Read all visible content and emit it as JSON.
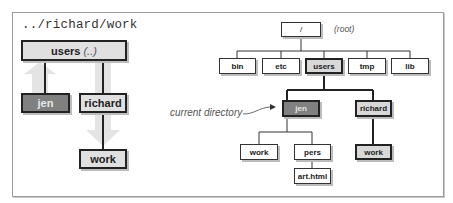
{
  "left_panel": {
    "path_text": "../richard/work",
    "users_box": {
      "label": "users",
      "annotation": "(..)"
    },
    "jen_box": {
      "label": "jen"
    },
    "richard_box": {
      "label": "richard"
    },
    "work_box": {
      "label": "work"
    },
    "arrows": [
      {
        "from": "jen",
        "to": "users",
        "direction": "up"
      },
      {
        "from": "richard",
        "to": "work",
        "direction": "down"
      }
    ]
  },
  "right_panel": {
    "root": {
      "label": "/",
      "annotation": "(root)"
    },
    "level1": [
      "bin",
      "etc",
      "users",
      "tmp",
      "lib"
    ],
    "highlighted_level1": "users",
    "users_children": [
      "jen",
      "richard"
    ],
    "jen_children": [
      "work",
      "pers"
    ],
    "pers_children": [
      "art.html"
    ],
    "richard_children": [
      "work"
    ],
    "callout": "current directory",
    "callout_target": "jen"
  },
  "colors": {
    "frame_border": "#9a9a9a",
    "box_border": "#222222",
    "highlight_light": "#e0e0e0",
    "highlight_dark": "#808080",
    "arrow_fill": "#e4e4e4"
  }
}
